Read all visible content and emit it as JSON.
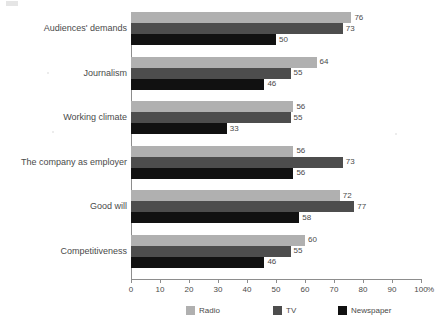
{
  "chart_data": {
    "type": "bar",
    "orientation": "horizontal",
    "title": "",
    "subtitle": "",
    "xlabel": "100 %",
    "ylabel": "",
    "xlim": [
      0,
      100
    ],
    "xticks": [
      "0",
      "10",
      "20",
      "30",
      "40",
      "50",
      "60",
      "70",
      "80",
      "90",
      "100"
    ],
    "axis_unit": "%",
    "grid": false,
    "legend_position": "bottom",
    "categories": [
      "Audiences' demands",
      "Journalism",
      "Working climate",
      "The company as employer",
      "Good will",
      "Competitiveness"
    ],
    "series": [
      {
        "name": "Radio",
        "color": "#b0b0b0",
        "values": [
          76,
          64,
          56,
          56,
          72,
          60
        ]
      },
      {
        "name": "TV",
        "color": "#4d4d4d",
        "values": [
          73,
          55,
          55,
          73,
          77,
          55
        ]
      },
      {
        "name": "Newspaper",
        "color": "#111111",
        "values": [
          50,
          46,
          33,
          56,
          58,
          46
        ]
      }
    ]
  },
  "legend": {
    "items": [
      {
        "label": "Radio",
        "key": "radio"
      },
      {
        "label": "TV",
        "key": "tv"
      },
      {
        "label": "Newspaper",
        "key": "newspaper"
      }
    ]
  }
}
